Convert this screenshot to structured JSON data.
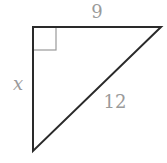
{
  "diagram": {
    "type": "right-triangle",
    "colors": {
      "stroke": "#2a2a2a",
      "right_angle_marker": "#9a9a9a",
      "labels": "#9a9a9a",
      "background": "#ffffff"
    },
    "vertices": {
      "right_angle": [
        33,
        27
      ],
      "top_right": [
        161,
        27
      ],
      "bottom_left": [
        33,
        151
      ]
    },
    "labels": {
      "top_side": "9",
      "left_side": "x",
      "hypotenuse": "12"
    }
  }
}
